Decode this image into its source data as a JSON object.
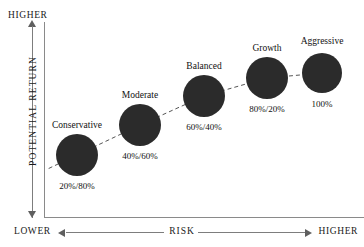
{
  "axes": {
    "y": {
      "title": "POTENTIAL RETURN",
      "high_label": "HIGHER",
      "low_label": "LOWER"
    },
    "x": {
      "title": "RISK",
      "low_label": "LOWER",
      "high_label": "HIGHER"
    }
  },
  "chart_data": {
    "type": "scatter",
    "title": "",
    "xlabel": "RISK",
    "ylabel": "POTENTIAL RETURN",
    "xlim": [
      0,
      1
    ],
    "ylim": [
      0,
      1
    ],
    "grid": false,
    "legend": "none",
    "connector": "dashed-line",
    "bubble_color": "#2b2b2b",
    "points": [
      {
        "name": "Conservative",
        "value": "20%/80%",
        "cx": 77,
        "cy": 155,
        "r": 21,
        "name_x": 77,
        "name_y": 120,
        "value_x": 77,
        "value_y": 181
      },
      {
        "name": "Moderate",
        "value": "40%/60%",
        "cx": 140,
        "cy": 125,
        "r": 21,
        "name_x": 140,
        "name_y": 90,
        "value_x": 140,
        "value_y": 151
      },
      {
        "name": "Balanced",
        "value": "60%/40%",
        "cx": 204,
        "cy": 96,
        "r": 21,
        "name_x": 204,
        "name_y": 61,
        "value_x": 204,
        "value_y": 122
      },
      {
        "name": "Growth",
        "value": "80%/20%",
        "cx": 267,
        "cy": 78,
        "r": 21,
        "name_x": 267,
        "name_y": 43,
        "value_x": 267,
        "value_y": 104
      },
      {
        "name": "Aggressive",
        "value": "100%",
        "cx": 322,
        "cy": 73,
        "r": 20,
        "name_x": 322,
        "name_y": 36,
        "value_x": 322,
        "value_y": 99
      }
    ]
  }
}
